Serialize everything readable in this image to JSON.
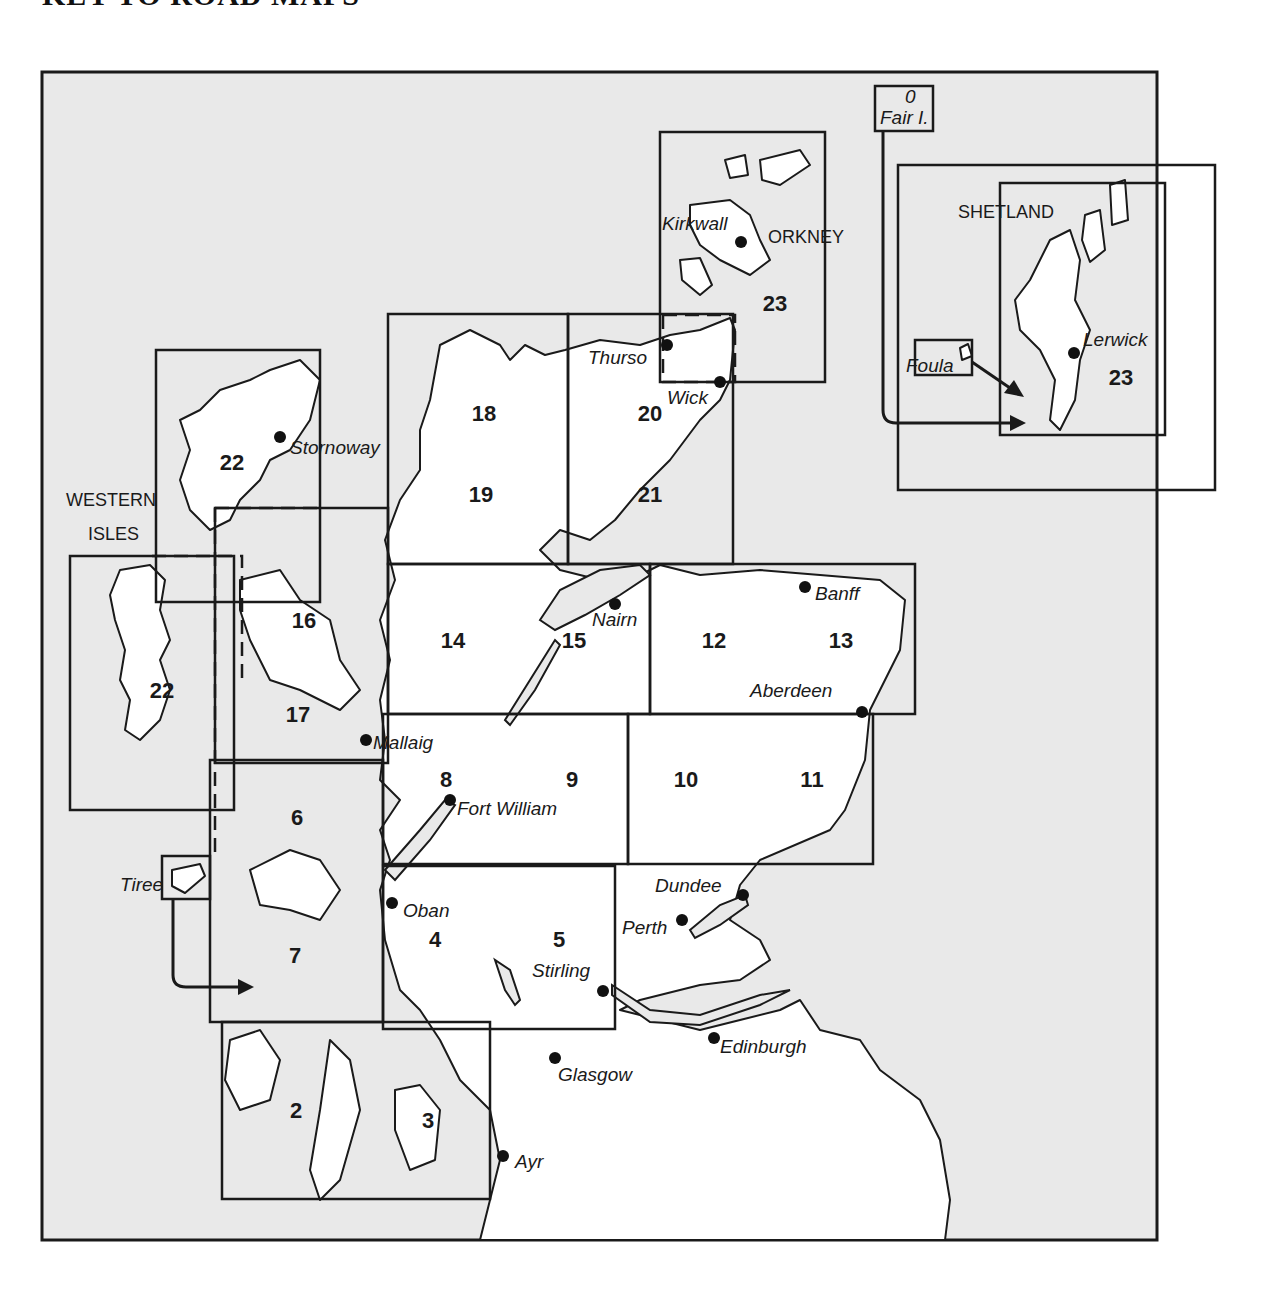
{
  "title": "KEY TO ROAD MAPS",
  "colors": {
    "sea": "#e9e9e9",
    "land": "#ffffff",
    "ink": "#1a1a1a"
  },
  "regions": {
    "orkney": "ORKNEY",
    "shetland": "SHETLAND",
    "western_isles_1": "WESTERN",
    "western_isles_2": "ISLES"
  },
  "sheets": [
    {
      "id": "2",
      "label": "2"
    },
    {
      "id": "3",
      "label": "3"
    },
    {
      "id": "4",
      "label": "4"
    },
    {
      "id": "5",
      "label": "5"
    },
    {
      "id": "6",
      "label": "6"
    },
    {
      "id": "7",
      "label": "7"
    },
    {
      "id": "8",
      "label": "8"
    },
    {
      "id": "9",
      "label": "9"
    },
    {
      "id": "10",
      "label": "10"
    },
    {
      "id": "11",
      "label": "11"
    },
    {
      "id": "12",
      "label": "12"
    },
    {
      "id": "13",
      "label": "13"
    },
    {
      "id": "14",
      "label": "14"
    },
    {
      "id": "15",
      "label": "15"
    },
    {
      "id": "16",
      "label": "16"
    },
    {
      "id": "17",
      "label": "17"
    },
    {
      "id": "18",
      "label": "18"
    },
    {
      "id": "19",
      "label": "19"
    },
    {
      "id": "20",
      "label": "20"
    },
    {
      "id": "21",
      "label": "21"
    },
    {
      "id": "22a",
      "label": "22"
    },
    {
      "id": "22b",
      "label": "22"
    },
    {
      "id": "23a",
      "label": "23"
    },
    {
      "id": "23b",
      "label": "23"
    }
  ],
  "towns": {
    "kirkwall": "Kirkwall",
    "lerwick": "Lerwick",
    "foula": "Foula",
    "fair_isle": "Fair I.",
    "fair_isle_glyph": "0",
    "thurso": "Thurso",
    "wick": "Wick",
    "stornoway": "Stornoway",
    "nairn": "Nairn",
    "banff": "Banff",
    "aberdeen": "Aberdeen",
    "mallaig": "Mallaig",
    "fort_william": "Fort William",
    "tiree": "Tiree",
    "oban": "Oban",
    "stirling": "Stirling",
    "dundee": "Dundee",
    "perth": "Perth",
    "glasgow": "Glasgow",
    "edinburgh": "Edinburgh",
    "ayr": "Ayr"
  }
}
